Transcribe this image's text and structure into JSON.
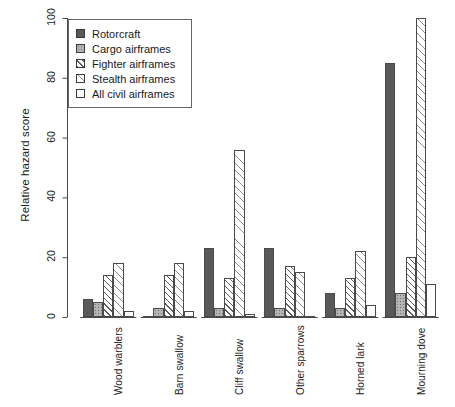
{
  "chart_data": {
    "type": "bar",
    "title": "",
    "subtitle": "",
    "xlabel": "",
    "ylabel": "Relative hazard score",
    "ylim": [
      0,
      100
    ],
    "yticks": [
      0,
      20,
      40,
      60,
      80,
      100
    ],
    "grid": false,
    "legend_position": "top-left",
    "categories": [
      "Wood warblers",
      "Barn swallow",
      "Cliff swallow",
      "Other sparrows",
      "Horned lark",
      "Mourning dove"
    ],
    "series": [
      {
        "name": "Rotorcraft",
        "fill": "solid-dark",
        "color": "#595959",
        "values": [
          6,
          0.5,
          23,
          23,
          8,
          85
        ]
      },
      {
        "name": "Cargo airframes",
        "fill": "dotted-gray",
        "color": "#b5b5b5",
        "values": [
          5,
          3,
          3,
          3,
          3,
          8
        ]
      },
      {
        "name": "Fighter airframes",
        "fill": "hatch",
        "color": "#ffffff",
        "values": [
          14,
          14,
          13,
          17,
          13,
          20
        ]
      },
      {
        "name": "Stealth airframes",
        "fill": "hatch-light",
        "color": "#ffffff",
        "values": [
          18,
          18,
          56,
          15,
          22,
          100
        ]
      },
      {
        "name": "All civil airframes",
        "fill": "white",
        "color": "#ffffff",
        "values": [
          2,
          2,
          1,
          0.4,
          4,
          11
        ]
      }
    ]
  },
  "legend": {
    "items": [
      "Rotorcraft",
      "Cargo airframes",
      "Fighter airframes",
      "Stealth airframes",
      "All civil airframes"
    ]
  }
}
